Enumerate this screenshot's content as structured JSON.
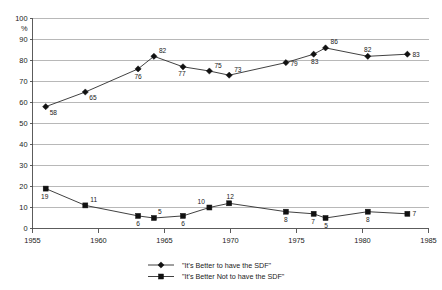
{
  "chart_data": {
    "type": "line",
    "title": "",
    "subtitle": "",
    "xlabel": "",
    "ylabel": "%",
    "xlim": [
      1955,
      1985
    ],
    "ylim": [
      0,
      100
    ],
    "grid": true,
    "legend_position": "bottom",
    "yticks": [
      0,
      10,
      20,
      30,
      40,
      50,
      60,
      70,
      80,
      90,
      100
    ],
    "ytick_labels": [
      "0",
      "10",
      "20",
      "30",
      "40",
      "50",
      "60",
      "70",
      "80",
      "90",
      "100"
    ],
    "xticks": [
      1955,
      1960,
      1965,
      1970,
      1975,
      1980,
      1985
    ],
    "xtick_labels": [
      "1955",
      "1960",
      "1965",
      "1970",
      "1975",
      "1980",
      "1985"
    ],
    "series": [
      {
        "name": "\"It's Better to have the SDF\"",
        "marker": "diamond",
        "color": "#111111",
        "x": [
          1956,
          1959,
          1963,
          1964.2,
          1966.4,
          1968.4,
          1969.9,
          1974.2,
          1976.3,
          1977.2,
          1980.4,
          1983.4
        ],
        "values": [
          58,
          65,
          76,
          82,
          77,
          75,
          73,
          79,
          83,
          86,
          82,
          83
        ],
        "labels": [
          "58",
          "65",
          "76",
          "82",
          "77",
          "75",
          "73",
          "79",
          "83",
          "86",
          "82",
          "83"
        ]
      },
      {
        "name": "\"It's Better Not to have the SDF\"",
        "marker": "square",
        "color": "#111111",
        "x": [
          1956,
          1959,
          1963,
          1964.2,
          1966.4,
          1968.4,
          1969.9,
          1974.2,
          1976.3,
          1977.2,
          1980.4,
          1983.4
        ],
        "values": [
          19,
          11,
          6,
          5,
          6,
          10,
          12,
          8,
          7,
          5,
          8,
          7
        ],
        "labels": [
          "19",
          "11",
          "6",
          "5",
          "6",
          "10",
          "12",
          "8",
          "7",
          "5",
          "8",
          "7"
        ]
      }
    ]
  },
  "legend": {
    "entries": [
      {
        "label": "\"It's Better to have the SDF\"",
        "marker": "diamond"
      },
      {
        "label": "\"It's Better Not to have the SDF\"",
        "marker": "square"
      }
    ]
  },
  "axes": {
    "y_unit_label": "%"
  }
}
